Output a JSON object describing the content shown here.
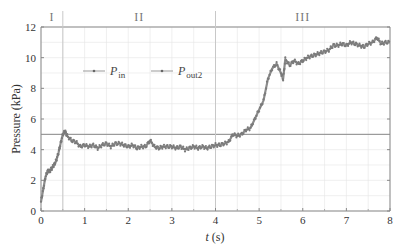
{
  "chart_data": {
    "type": "scatter",
    "title": "",
    "xlabel": "t (s)",
    "ylabel": "Pressure (kPa)",
    "xlim": [
      0,
      8
    ],
    "ylim": [
      0,
      12
    ],
    "xticks": [
      0,
      1,
      2,
      3,
      4,
      5,
      6,
      7,
      8
    ],
    "yticks": [
      0,
      2,
      4,
      6,
      8,
      10,
      12
    ],
    "grid": true,
    "legend_position": "upper-left, inside plot",
    "legend": [
      {
        "name": "P_in",
        "label_main": "P",
        "label_sub": "in"
      },
      {
        "name": "P_out2",
        "label_main": "P",
        "label_sub": "out2"
      }
    ],
    "regions": [
      {
        "label": "I",
        "x_start": 0,
        "x_end": 0.5
      },
      {
        "label": "II",
        "x_start": 0.5,
        "x_end": 4
      },
      {
        "label": "III",
        "x_start": 4,
        "x_end": 8
      }
    ],
    "reference_lines": {
      "horizontal": [
        {
          "y": 5
        }
      ],
      "vertical": [
        {
          "x": 0.5
        },
        {
          "x": 4
        }
      ]
    },
    "series": [
      {
        "name": "P_in / P_out2 (measured)",
        "x": [
          0.0,
          0.05,
          0.1,
          0.15,
          0.2,
          0.25,
          0.3,
          0.35,
          0.4,
          0.45,
          0.5,
          0.55,
          0.6,
          0.7,
          0.8,
          0.9,
          1.0,
          1.1,
          1.2,
          1.3,
          1.4,
          1.5,
          1.6,
          1.7,
          1.8,
          1.9,
          2.0,
          2.1,
          2.2,
          2.3,
          2.4,
          2.5,
          2.6,
          2.7,
          2.8,
          2.9,
          3.0,
          3.1,
          3.2,
          3.3,
          3.4,
          3.5,
          3.6,
          3.7,
          3.8,
          3.9,
          4.0,
          4.1,
          4.2,
          4.3,
          4.4,
          4.5,
          4.6,
          4.7,
          4.8,
          4.9,
          5.0,
          5.1,
          5.2,
          5.3,
          5.4,
          5.5,
          5.55,
          5.6,
          5.7,
          5.8,
          5.9,
          6.0,
          6.1,
          6.2,
          6.3,
          6.4,
          6.5,
          6.6,
          6.7,
          6.8,
          6.9,
          7.0,
          7.1,
          7.2,
          7.3,
          7.4,
          7.5,
          7.6,
          7.7,
          7.8,
          7.9,
          8.0
        ],
        "y": [
          0.6,
          1.4,
          2.2,
          2.6,
          2.6,
          2.8,
          3.0,
          3.3,
          3.8,
          4.4,
          5.0,
          5.2,
          4.9,
          4.6,
          4.5,
          4.2,
          4.3,
          4.2,
          4.3,
          4.1,
          4.3,
          4.4,
          4.2,
          4.4,
          4.4,
          4.3,
          4.2,
          4.3,
          4.1,
          4.2,
          4.2,
          4.6,
          4.2,
          4.1,
          4.2,
          4.2,
          4.2,
          4.1,
          4.2,
          4.0,
          4.1,
          4.2,
          4.1,
          4.2,
          4.1,
          4.2,
          4.3,
          4.3,
          4.4,
          4.5,
          5.0,
          4.9,
          5.0,
          5.3,
          5.4,
          6.0,
          6.6,
          7.2,
          8.6,
          9.3,
          9.6,
          9.0,
          8.6,
          9.9,
          9.5,
          9.8,
          9.6,
          9.8,
          10.0,
          10.1,
          10.2,
          10.3,
          10.4,
          10.5,
          10.8,
          10.8,
          10.9,
          10.8,
          11.0,
          10.9,
          10.8,
          10.7,
          10.9,
          11.0,
          11.3,
          10.9,
          11.0,
          11.0
        ]
      }
    ]
  }
}
